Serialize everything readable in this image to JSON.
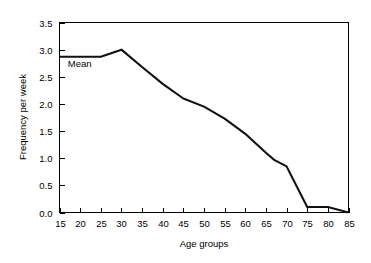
{
  "chart_data": {
    "type": "line",
    "title": "",
    "xlabel": "Age groups",
    "ylabel": "Frequency per week",
    "xlim": [
      15,
      85
    ],
    "ylim": [
      0.0,
      3.5
    ],
    "grid": false,
    "legend": null,
    "xticks": [
      15,
      20,
      25,
      30,
      35,
      40,
      45,
      50,
      55,
      60,
      65,
      70,
      75,
      80,
      85
    ],
    "xtick_labels": [
      "15",
      "20",
      "25",
      "30",
      "35",
      "40",
      "45",
      "50",
      "55",
      "60",
      "65",
      "70",
      "75",
      "80",
      "85"
    ],
    "yticks": [
      0.0,
      0.5,
      1.0,
      1.5,
      2.0,
      2.5,
      3.0,
      3.5
    ],
    "ytick_labels": [
      "0.0",
      "0.5",
      "1.0",
      "1.5",
      "2.0",
      "2.5",
      "3.0",
      "3.5"
    ],
    "annotations": [
      {
        "text": "Mean",
        "x": 17,
        "y": 2.68
      }
    ],
    "series": [
      {
        "name": "Mean",
        "color": "#111111",
        "x": [
          15,
          20,
          25,
          30,
          35,
          40,
          45,
          50,
          55,
          60,
          65,
          67,
          70,
          75,
          80,
          85
        ],
        "values": [
          2.87,
          2.87,
          2.87,
          3.0,
          2.68,
          2.37,
          2.1,
          1.95,
          1.73,
          1.45,
          1.1,
          0.97,
          0.85,
          0.1,
          0.1,
          0.0
        ]
      }
    ]
  },
  "axes": {
    "x_label": "Age groups",
    "y_label": "Frequency per week"
  },
  "annotation": {
    "mean_label": "Mean"
  }
}
